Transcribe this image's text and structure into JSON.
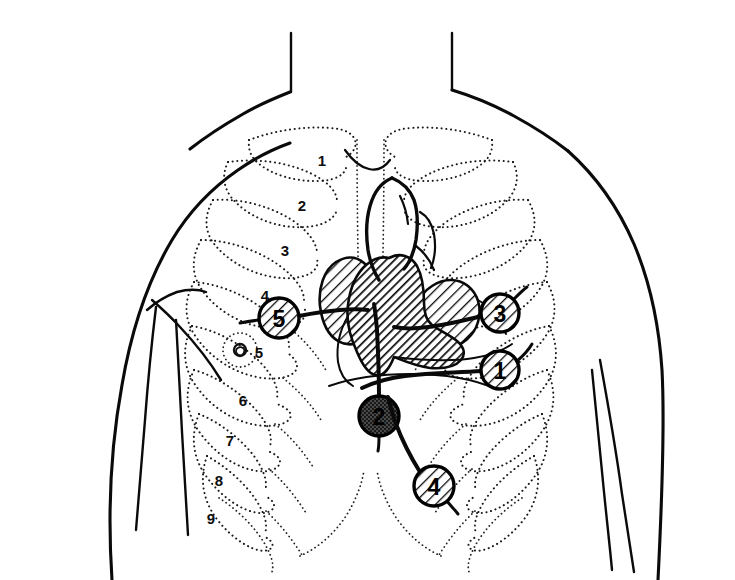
{
  "diagram": {
    "background_color": "#ffffff",
    "ink_color": "#0a0a0a",
    "width": 735,
    "height": 580
  },
  "auscultation_sites": [
    {
      "number": "1",
      "cx": 500,
      "cy": 370,
      "r": 19,
      "fill": "hatch-light",
      "lead_path": "M 482 371 C 455 373 432 372 405 376 C 388 378 375 382 362 388",
      "tail_path": "M 516 362 C 523 356 528 351 532 344"
    },
    {
      "number": "2",
      "cx": 379,
      "cy": 416,
      "r": 20,
      "fill": "stipple-dark",
      "lead_path": "M 379 396 C 379 372 378 350 377 330 C 376 318 375 310 374 304",
      "tail_path": "M 379 436 C 379 442 379 446 378 451"
    },
    {
      "number": "3",
      "cx": 500,
      "cy": 313,
      "r": 19,
      "fill": "hatch-light",
      "lead_path": "M 482 316 C 462 321 446 325 428 327 C 414 329 404 329 394 327",
      "tail_path": "M 514 299 C 519 294 523 290 527 287"
    },
    {
      "number": "4",
      "cx": 434,
      "cy": 486,
      "r": 20,
      "fill": "hatch-light",
      "lead_path": "M 420 472 C 410 456 402 440 396 424 C 392 413 390 405 388 397",
      "tail_path": "M 446 500 C 451 506 455 510 458 514"
    },
    {
      "number": "5",
      "cx": 279,
      "cy": 318,
      "r": 20,
      "fill": "hatch-light",
      "lead_path": "M 299 316 C 314 313 327 311 340 310 C 352 309 360 309 368 310",
      "tail_path": "M 259 320 C 251 321 245 322 240 323"
    }
  ],
  "rib_numbers": [
    {
      "label": "1",
      "x": 322,
      "y": 160
    },
    {
      "label": "2",
      "x": 302,
      "y": 205
    },
    {
      "label": "3",
      "x": 285,
      "y": 250
    },
    {
      "label": "4",
      "x": 265,
      "y": 295
    },
    {
      "label": "6",
      "x": 243,
      "y": 400
    },
    {
      "label": "7",
      "x": 230,
      "y": 440
    },
    {
      "label": "8",
      "x": 219,
      "y": 480
    },
    {
      "label": "9",
      "x": 211,
      "y": 518
    }
  ],
  "nipple_marker": {
    "label": "5",
    "cx": 240,
    "cy": 350,
    "areola_r": 17,
    "nipple_r": 6,
    "label_x": 259,
    "label_y": 352
  },
  "legend_note": "Numbered circles 1-5 mark standard precordial listening points; dotted outlines show ribs 1-9."
}
